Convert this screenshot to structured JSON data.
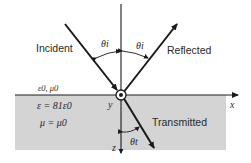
{
  "diagram": {
    "type": "wave-incidence-at-interface",
    "rays": {
      "incident": "Incident",
      "reflected": "Reflected",
      "transmitted": "Transmitted"
    },
    "angles": {
      "incident": "θi",
      "reflected": "θi",
      "transmitted": "θt"
    },
    "region1": {
      "params": "ε0, μ0"
    },
    "region2": {
      "epsilon": "ε = 81ε0",
      "mu": "μ = μ0"
    },
    "axes": {
      "x": "x",
      "y": "y",
      "z": "z"
    },
    "colors": {
      "medium_fill": "#d4d4d4",
      "line": "#1a1a1a",
      "background": "#ffffff"
    }
  }
}
